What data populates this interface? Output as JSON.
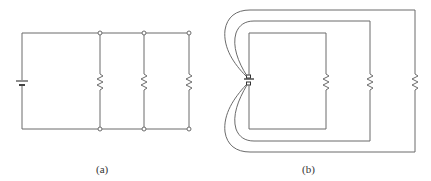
{
  "figure": {
    "panels": [
      {
        "id": "a",
        "label": "(a)",
        "description": "Battery connected in parallel with three resistors via top and bottom bus wires with junction nodes",
        "components": {
          "battery": 1,
          "resistors": 3,
          "nodes": 6
        }
      },
      {
        "id": "b",
        "label": "(b)",
        "description": "Same parallel circuit redrawn as three nested loops, each resistor wired directly to the battery terminals",
        "components": {
          "battery": 1,
          "resistors": 3,
          "loops": 3
        }
      }
    ],
    "colors": {
      "wire": "#6b6b6b",
      "node_fill": "#ffffff",
      "background": "#ffffff",
      "label": "#333333"
    }
  }
}
